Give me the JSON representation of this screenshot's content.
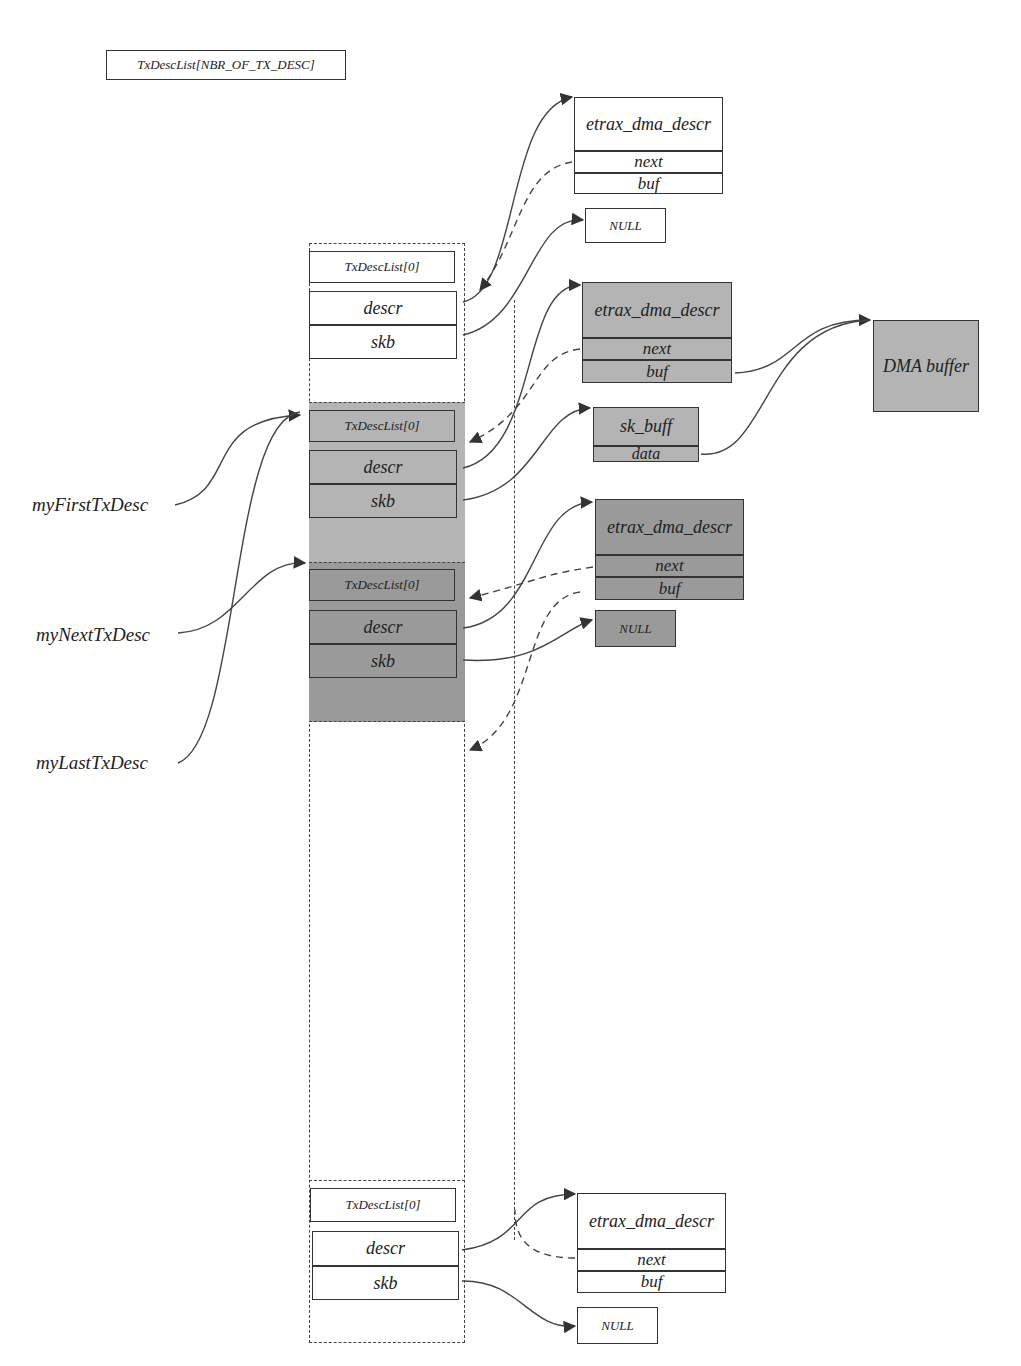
{
  "diagram": {
    "title": "TxDescList[NBR_OF_TX_DESC]",
    "entries": [
      {
        "header": "TxDescList[0]",
        "fields": [
          "descr",
          "skb"
        ],
        "shade": "white"
      },
      {
        "header": "TxDescList[0]",
        "fields": [
          "descr",
          "skb"
        ],
        "shade": "light-gray"
      },
      {
        "header": "TxDescList[0]",
        "fields": [
          "descr",
          "skb"
        ],
        "shade": "dark-gray"
      },
      {
        "header": "TxDescList[0]",
        "fields": [
          "descr",
          "skb"
        ],
        "shade": "white"
      }
    ],
    "pointers": {
      "first": "myFirstTxDesc",
      "next": "myNextTxDesc",
      "last": "myLastTxDesc"
    },
    "dma_descrs": [
      {
        "title": "etrax_dma_descr",
        "fields": [
          "next",
          "buf"
        ],
        "shade": "white"
      },
      {
        "title": "etrax_dma_descr",
        "fields": [
          "next",
          "buf"
        ],
        "shade": "light-gray"
      },
      {
        "title": "etrax_dma_descr",
        "fields": [
          "next",
          "buf"
        ],
        "shade": "dark-gray"
      },
      {
        "title": "etrax_dma_descr",
        "fields": [
          "next",
          "buf"
        ],
        "shade": "white"
      }
    ],
    "nulls": [
      "NULL",
      "NULL",
      "NULL"
    ],
    "sk_buff": {
      "title": "sk_buff",
      "field": "data"
    },
    "dma_buffer": "DMA buffer",
    "colors": {
      "light_gray": "#b4b4b4",
      "dark_gray": "#9a9a9a",
      "line": "#333333"
    }
  }
}
